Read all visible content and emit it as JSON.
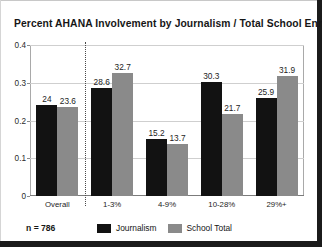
{
  "chart_data": {
    "type": "bar",
    "title": "Percent AHANA  Involvement  by Journalism / Total School Enrollments",
    "xlabel": "",
    "ylabel": "",
    "categories": [
      "Overall",
      "1-3%",
      "4-9%",
      "10-28%",
      "29%+"
    ],
    "series": [
      {
        "name": "Journalism",
        "color": "#121212",
        "values": [
          24,
          28.6,
          15.2,
          30.3,
          25.9
        ],
        "labels": [
          "24",
          "28.6",
          "15.2",
          "30.3",
          "25.9"
        ]
      },
      {
        "name": "School Total",
        "color": "#8a8a8a",
        "values": [
          23.6,
          32.7,
          13.7,
          21.7,
          31.9
        ],
        "labels": [
          "23.6",
          "32.7",
          "13.7",
          "21.7",
          "31.9"
        ]
      }
    ],
    "ylim": [
      0,
      0.4
    ],
    "yticks": [
      "0",
      "0.1",
      "0.2",
      "0.3",
      "0.4"
    ],
    "ytick_values": [
      0,
      0.1,
      0.2,
      0.3,
      0.4
    ],
    "grid": true,
    "legend_position": "bottom",
    "annotations": {
      "sample_size": "n = 786",
      "divider_after_category": "Overall"
    }
  },
  "legend": {
    "items": [
      {
        "label": "Journalism",
        "swatch": "journalism"
      },
      {
        "label": "School Total",
        "swatch": "school"
      }
    ]
  }
}
